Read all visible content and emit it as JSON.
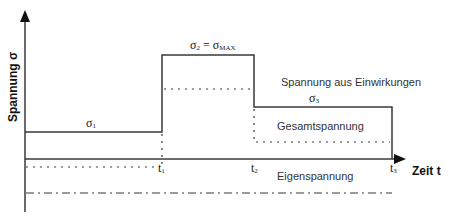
{
  "axes": {
    "y_label": "Spannung σ",
    "x_label": "Zeit t"
  },
  "levels": {
    "sigma1": "σ",
    "sigma1_sub": "1",
    "sigma2": "σ",
    "sigma2_sub": "2",
    "sigma2_eq": " = σ",
    "sigma2_max": "MAX",
    "sigma3": "σ",
    "sigma3_sub": "3"
  },
  "time_marks": [
    {
      "t": "t",
      "sub": "1"
    },
    {
      "t": "t",
      "sub": "2"
    },
    {
      "t": "t",
      "sub": "3"
    }
  ],
  "legend": {
    "applied": "Spannung aus Einwirkungen",
    "total": "Gesamtspannung",
    "residual": "Eigenspannung"
  },
  "colors": {
    "line": "#3a3a3a",
    "text": "#333333"
  }
}
